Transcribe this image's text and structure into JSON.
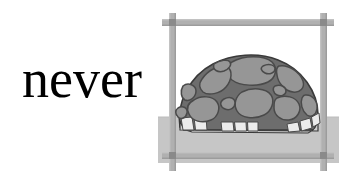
{
  "card": {
    "type": "vocabulary-flashcard",
    "background_color": "#ffffff",
    "word": "never",
    "word_color": "#000000"
  },
  "illustration": {
    "name": "tortoise-in-frame",
    "subject": "tortoise shell",
    "setting": "wooden post frame on ground",
    "palette": {
      "frame_post": "#b0b0b0",
      "frame_post_edge": "#9a9a9a",
      "frame_joint": "#8c8c8c",
      "ground": "#c6c6c6",
      "ground_edge": "#b8b8b8",
      "shell_base": "#6d6d6d",
      "shell_outline": "#3a3a3a",
      "scute_fill": "#969696",
      "scute_outline": "#4a4a4a",
      "marginal_scute": "#ebebeb",
      "marginal_band": "#cfcfcf",
      "opening_dark": "#0d0d0d"
    },
    "parts": [
      {
        "name": "frame-top-rail",
        "label": "top rail"
      },
      {
        "name": "frame-bottom-rail",
        "label": "bottom rail"
      },
      {
        "name": "frame-left-post",
        "label": "left post"
      },
      {
        "name": "frame-right-post",
        "label": "right post"
      },
      {
        "name": "ground-plane",
        "label": "ground"
      },
      {
        "name": "tortoise-shell",
        "label": "shell dome"
      },
      {
        "name": "shell-scutes",
        "label": "shell plates"
      },
      {
        "name": "marginal-scute-band",
        "label": "marginal scutes"
      },
      {
        "name": "shell-openings",
        "label": "leg openings"
      }
    ],
    "scute_count": 13,
    "marginal_scute_count": 9,
    "opening_count": 2
  }
}
